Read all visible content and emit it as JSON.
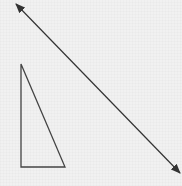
{
  "diagram": {
    "background": "#f1f1f1",
    "stroke": "#333333",
    "line": {
      "type": "double-arrow",
      "x1": 16,
      "y1": 4,
      "x2": 180,
      "y2": 173
    },
    "triangle": {
      "type": "right-triangle",
      "points": [
        [
          21,
          64
        ],
        [
          21,
          167
        ],
        [
          65,
          167
        ]
      ]
    }
  }
}
